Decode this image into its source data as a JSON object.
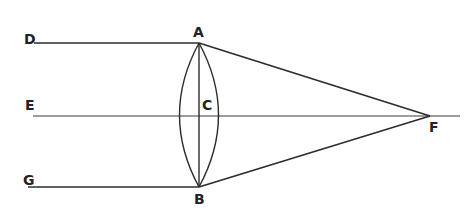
{
  "diagram": {
    "type": "optics-convex-lens-focus",
    "labels": {
      "D": "D",
      "A": "A",
      "E": "E",
      "C": "C",
      "G": "G",
      "B": "B",
      "F": "F"
    },
    "colors": {
      "ink": "#2b2b2b",
      "background": "#ffffff"
    }
  }
}
